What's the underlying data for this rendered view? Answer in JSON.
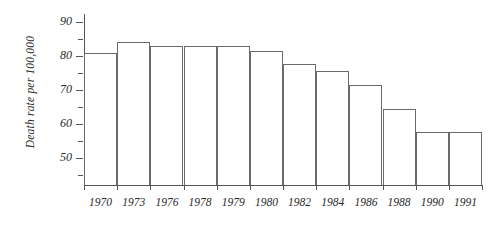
{
  "chart_data": {
    "type": "bar",
    "title": "",
    "xlabel": "",
    "ylabel": "Death rate per 100,000",
    "categories": [
      "1970",
      "1973",
      "1976",
      "1978",
      "1979",
      "1980",
      "1982",
      "1984",
      "1986",
      "1988",
      "1990",
      "1991"
    ],
    "values": [
      81,
      84,
      83,
      83,
      83,
      81.5,
      77.5,
      75.5,
      71.5,
      64.5,
      57.5,
      57.5
    ],
    "ylim": [
      42,
      92
    ],
    "y_major_ticks": [
      50,
      60,
      70,
      80,
      90
    ],
    "y_minor_ticks": [
      45,
      55,
      65,
      75,
      85
    ],
    "y_tick_labels": [
      "50",
      "60",
      "70",
      "80",
      "90"
    ],
    "grid": false,
    "legend": "none",
    "bar_fill_color": "#ffffff",
    "bar_border_color": "#6a6a6a",
    "axis_color": "#555555",
    "text_color": "#2a2a2a"
  },
  "axes": {
    "y_title": "Death rate per 100,000"
  }
}
